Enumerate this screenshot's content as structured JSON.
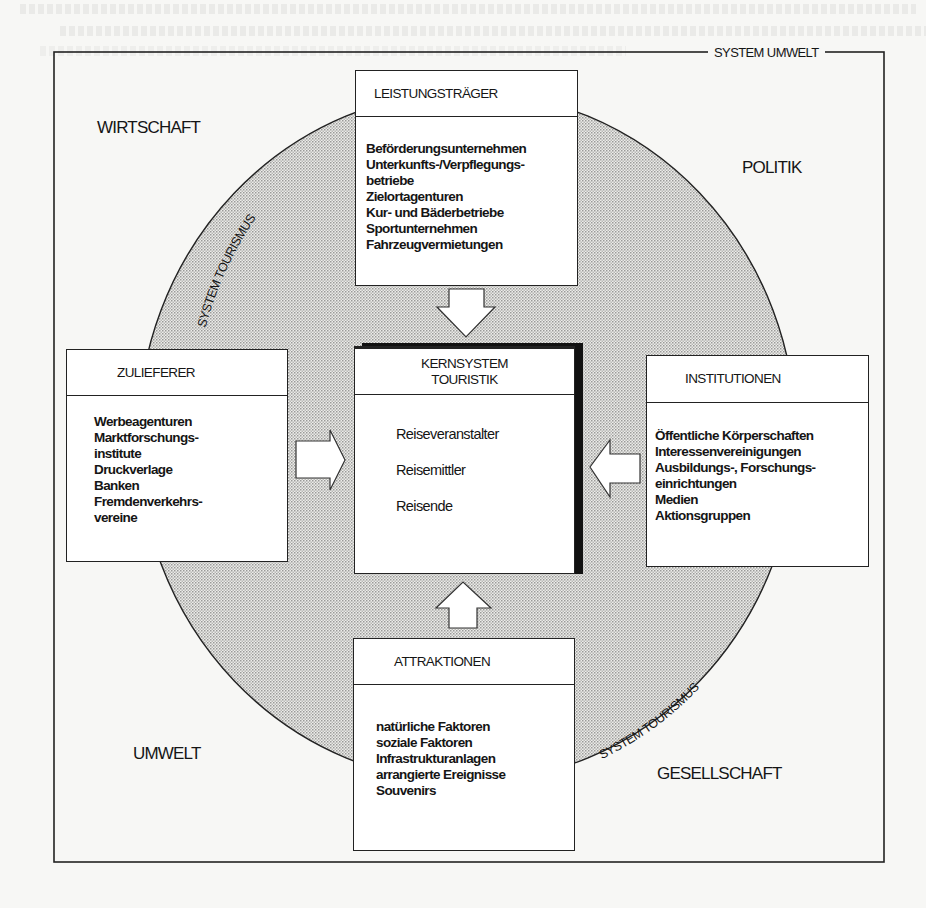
{
  "diagram": {
    "frame_label": "SYSTEM UMWELT",
    "circle_label": "SYSTEM TOURISMUS",
    "colors": {
      "line": "#222222",
      "circle_fill": "#d9d9d6",
      "box_fill": "#ffffff",
      "page": "#f7f7f5"
    },
    "regions": {
      "top_left": "WIRTSCHAFT",
      "top_right": "POLITIK",
      "bottom_left": "UMWELT",
      "bottom_right": "GESELLSCHAFT"
    },
    "boxes": {
      "leistungstraeger": {
        "title": "LEISTUNGSTRÄGER",
        "items": [
          "Beförderungsunternehmen",
          "Unterkunfts-/Verpflegungs-",
          "betriebe",
          "Zielortagenturen",
          "Kur- und Bäderbetriebe",
          "Sportunternehmen",
          "Fahrzeugvermietungen"
        ]
      },
      "zulieferer": {
        "title": "ZULIEFERER",
        "items": [
          "Werbeagenturen",
          "Marktforschungs-",
          "institute",
          "Druckverlage",
          "Banken",
          "Fremdenverkehrs-",
          "vereine"
        ]
      },
      "kernsystem": {
        "title_line1": "KERNSYSTEM",
        "title_line2": "TOURISTIK",
        "items": [
          "Reiseveranstalter",
          "Reisemittler",
          "Reisende"
        ]
      },
      "institutionen": {
        "title": "INSTITUTIONEN",
        "items": [
          "Öffentliche Körperschaften",
          "Interessenvereinigungen",
          "Ausbildungs-, Forschungs-",
          "einrichtungen",
          "Medien",
          "Aktionsgruppen"
        ]
      },
      "attraktionen": {
        "title": "ATTRAKTIONEN",
        "items": [
          "natürliche Faktoren",
          "soziale Faktoren",
          "Infrastrukturanlagen",
          "arrangierte Ereignisse",
          "Souvenirs"
        ]
      }
    },
    "arrows": [
      {
        "from": "LEISTUNGSTRÄGER",
        "to": "KERNSYSTEM TOURISTIK",
        "direction": "down"
      },
      {
        "from": "ZULIEFERER",
        "to": "KERNSYSTEM TOURISTIK",
        "direction": "right"
      },
      {
        "from": "INSTITUTIONEN",
        "to": "KERNSYSTEM TOURISTIK",
        "direction": "left"
      },
      {
        "from": "ATTRAKTIONEN",
        "to": "KERNSYSTEM TOURISTIK",
        "direction": "up"
      }
    ]
  }
}
